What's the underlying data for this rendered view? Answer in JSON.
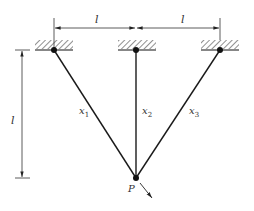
{
  "diagram": {
    "type": "three-bar truss / cable system",
    "top_dimensions": [
      {
        "label": "l",
        "from": "left-support",
        "to": "middle-support"
      },
      {
        "label": "l",
        "from": "middle-support",
        "to": "right-support"
      }
    ],
    "vertical_dimension": {
      "label": "l"
    },
    "members": [
      {
        "label_base": "x",
        "label_sub": "1",
        "from": "left-support",
        "to": "P"
      },
      {
        "label_base": "x",
        "label_sub": "2",
        "from": "middle-support",
        "to": "P"
      },
      {
        "label_base": "x",
        "label_sub": "3",
        "from": "right-support",
        "to": "P"
      }
    ],
    "load_point": {
      "label": "P"
    },
    "supports": [
      "left",
      "middle",
      "right"
    ],
    "colors": {
      "line": "#1a1a1a",
      "hatch": "#444444",
      "dim": "#333333"
    }
  }
}
